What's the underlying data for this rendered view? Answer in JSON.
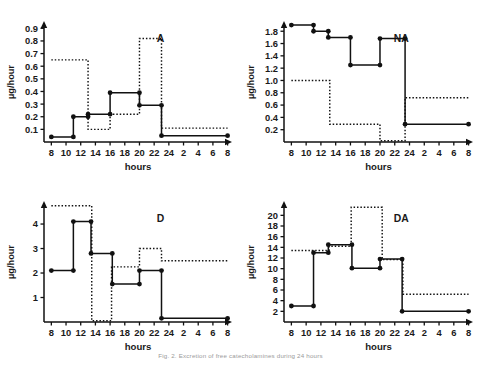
{
  "figure": {
    "caption": "Fig. 2. Excretion of free catecholamines during 24 hours",
    "x_axis_label": "hours",
    "y_axis_label": "µg/hour",
    "x_ticks": [
      "8",
      "10",
      "12",
      "14",
      "16",
      "18",
      "20",
      "22",
      "24",
      "2",
      "4",
      "6",
      "8"
    ],
    "x_values": [
      8,
      10,
      12,
      14,
      16,
      18,
      20,
      22,
      24,
      26,
      28,
      30,
      32
    ]
  },
  "chart_data": [
    {
      "type": "line",
      "panel_label": "A",
      "title": "A",
      "xlabel": "hours",
      "ylabel": "µg/hour",
      "xlim": [
        7,
        32.6
      ],
      "ylim": [
        0,
        0.95
      ],
      "yticks": [
        0.1,
        0.2,
        0.3,
        0.4,
        0.5,
        0.6,
        0.7,
        0.8,
        0.9
      ],
      "ytick_labels": [
        "0.1",
        "0.2",
        "0.3",
        "0.4",
        "0.5",
        "0.6",
        "0.7",
        "0.8",
        "0.9"
      ],
      "grid": false,
      "series": [
        {
          "name": "solid",
          "style": "solid",
          "markers": true,
          "step_edges": [
            8,
            11,
            13,
            16,
            20,
            23,
            32
          ],
          "values": [
            0.04,
            0.2,
            0.22,
            0.39,
            0.29,
            0.05
          ]
        },
        {
          "name": "dotted",
          "style": "dotted",
          "markers": false,
          "step_edges": [
            8,
            13,
            13,
            16,
            20,
            23,
            32
          ],
          "values": [
            0.65,
            0.1,
            0.1,
            0.22,
            0.82,
            0.11
          ]
        }
      ]
    },
    {
      "type": "line",
      "panel_label": "NA",
      "title": "NA",
      "xlabel": "hours",
      "ylabel": "µg/hour",
      "xlim": [
        7,
        32.6
      ],
      "ylim": [
        0,
        1.95
      ],
      "yticks": [
        0.2,
        0.4,
        0.6,
        0.8,
        1.0,
        1.2,
        1.4,
        1.6,
        1.8
      ],
      "ytick_labels": [
        "0.2",
        "0.4",
        "0.6",
        "0.8",
        "1.0",
        "1.2",
        "1.4",
        "1.6",
        "1.8"
      ],
      "grid": false,
      "series": [
        {
          "name": "solid",
          "style": "solid",
          "markers": true,
          "step_edges": [
            8,
            11,
            13,
            16,
            20,
            23.4,
            32
          ],
          "values": [
            1.9,
            1.8,
            1.7,
            1.25,
            1.68,
            0.29
          ]
        },
        {
          "name": "dotted",
          "style": "dotted",
          "markers": false,
          "step_edges": [
            8,
            13.2,
            20,
            23.4,
            32
          ],
          "values": [
            1.0,
            0.29,
            0.02,
            0.72
          ]
        }
      ]
    },
    {
      "type": "line",
      "panel_label": "D",
      "title": "D",
      "xlabel": "hours",
      "ylabel": "µg/hour",
      "xlim": [
        7,
        32.6
      ],
      "ylim": [
        0,
        4.9
      ],
      "yticks": [
        1,
        2,
        3,
        4
      ],
      "ytick_labels": [
        "1",
        "2",
        "3",
        "4"
      ],
      "grid": false,
      "series": [
        {
          "name": "solid",
          "style": "solid",
          "markers": true,
          "step_edges": [
            8,
            11,
            13.4,
            16.3,
            20,
            23,
            32
          ],
          "values": [
            2.1,
            4.1,
            2.8,
            1.55,
            2.1,
            0.15
          ]
        },
        {
          "name": "dotted",
          "style": "dotted",
          "markers": false,
          "step_edges": [
            8,
            13.5,
            16.2,
            20,
            23,
            32
          ],
          "values": [
            4.75,
            0.05,
            2.25,
            3.0,
            2.5
          ]
        }
      ]
    },
    {
      "type": "line",
      "panel_label": "DA",
      "title": "DA",
      "xlabel": "hours",
      "ylabel": "µg/hour",
      "xlim": [
        7,
        32.6
      ],
      "ylim": [
        0,
        22.5
      ],
      "yticks": [
        2,
        4,
        6,
        8,
        10,
        12,
        14,
        16,
        18,
        20
      ],
      "ytick_labels": [
        "2",
        "4",
        "6",
        "8",
        "10",
        "12",
        "14",
        "16",
        "18",
        "20"
      ],
      "grid": false,
      "series": [
        {
          "name": "solid",
          "style": "solid",
          "markers": true,
          "step_edges": [
            8,
            11,
            13,
            16.2,
            20,
            23,
            32
          ],
          "values": [
            3.0,
            13.0,
            14.5,
            10.1,
            11.8,
            2.0
          ]
        },
        {
          "name": "dotted",
          "style": "dotted",
          "markers": false,
          "step_edges": [
            8,
            13.1,
            16.1,
            20.3,
            23.1,
            32
          ],
          "values": [
            13.4,
            14.2,
            21.5,
            11.7,
            5.2
          ]
        }
      ]
    }
  ]
}
